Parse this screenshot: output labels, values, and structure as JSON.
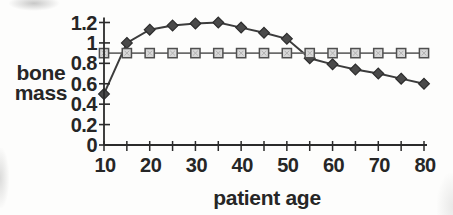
{
  "chart_data": {
    "type": "line",
    "title": "",
    "xlabel": "patient age",
    "ylabel": "bone mass",
    "ylabel_lines": [
      "bone",
      "mass"
    ],
    "xlim": [
      10,
      80
    ],
    "ylim": [
      0,
      1.2
    ],
    "grid": false,
    "legend": "none",
    "x": [
      10,
      15,
      20,
      25,
      30,
      35,
      40,
      45,
      50,
      55,
      60,
      65,
      70,
      75,
      80
    ],
    "x_minor_tick_step": 5,
    "x_ticks": [
      {
        "value": 10,
        "label": "10"
      },
      {
        "value": 20,
        "label": "20"
      },
      {
        "value": 30,
        "label": "30"
      },
      {
        "value": 40,
        "label": "40"
      },
      {
        "value": 50,
        "label": "50"
      },
      {
        "value": 60,
        "label": "60"
      },
      {
        "value": 70,
        "label": "70"
      },
      {
        "value": 80,
        "label": "80"
      }
    ],
    "y_ticks": [
      {
        "value": 0,
        "label": "0"
      },
      {
        "value": 0.2,
        "label": "0.2"
      },
      {
        "value": 0.4,
        "label": "0.4"
      },
      {
        "value": 0.6,
        "label": "0.6"
      },
      {
        "value": 0.8,
        "label": "0.8"
      },
      {
        "value": 1,
        "label": "1"
      },
      {
        "value": 1.2,
        "label": "1.2"
      }
    ],
    "series": [
      {
        "name": "bone-mass-by-age",
        "marker": "diamond",
        "line_color": "#3c3c3c",
        "marker_fill": "#4a4a4a",
        "marker_stroke": "#2d2d2d",
        "values": [
          0.5,
          1.0,
          1.13,
          1.17,
          1.19,
          1.2,
          1.15,
          1.1,
          1.04,
          0.85,
          0.79,
          0.74,
          0.7,
          0.65,
          0.6
        ]
      },
      {
        "name": "reference-level",
        "marker": "square",
        "line_color": "#6b6b6b",
        "marker_fill": "#d9d9d9",
        "marker_stroke": "#4f4f4f",
        "values": [
          0.9,
          0.9,
          0.9,
          0.9,
          0.9,
          0.9,
          0.9,
          0.9,
          0.9,
          0.9,
          0.9,
          0.9,
          0.9,
          0.9,
          0.9
        ]
      }
    ],
    "axis_color": "#2b2b2b"
  }
}
